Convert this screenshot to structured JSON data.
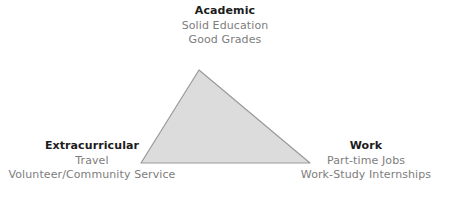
{
  "diagram": {
    "type": "triangle-venn-corner-labels",
    "background_color": "#ffffff",
    "shape": {
      "name": "balance-triangle",
      "fill_color": "#dcdcdc",
      "stroke_color": "#9a9a9a",
      "vertices": {
        "apex": [
          199,
          70
        ],
        "bottom_left": [
          141,
          163
        ],
        "bottom_right": [
          310,
          163
        ]
      }
    },
    "corners": [
      {
        "id": "academic",
        "title": "Academic",
        "items": [
          "Solid Education",
          "Good Grades"
        ]
      },
      {
        "id": "extracurricular",
        "title": "Extracurricular",
        "items": [
          "Travel",
          "Volunteer/Community Service"
        ]
      },
      {
        "id": "work",
        "title": "Work",
        "items": [
          "Part-time Jobs",
          "Work-Study Internships"
        ]
      }
    ],
    "colors": {
      "title_text": "#1c1c1c",
      "item_text": "#7d7d7d",
      "shape_fill": "#dcdcdc",
      "shape_stroke": "#9a9a9a"
    }
  }
}
